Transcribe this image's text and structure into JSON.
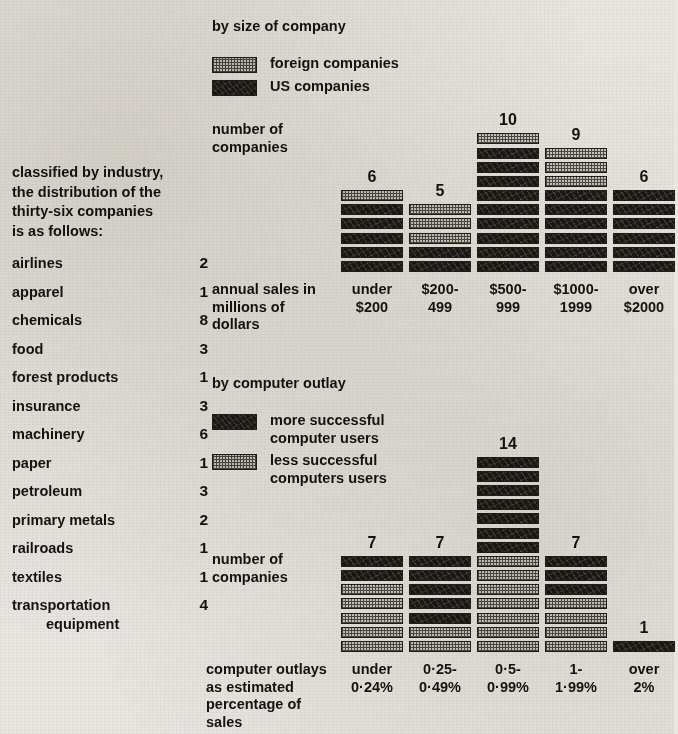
{
  "left_panel": {
    "intro": "classified by industry,\nthe distribution of the\nthirty-six companies\nis as follows:",
    "rows": [
      {
        "name": "airlines",
        "value": "2"
      },
      {
        "name": "apparel",
        "value": "1"
      },
      {
        "name": "chemicals",
        "value": "8"
      },
      {
        "name": "food",
        "value": "3"
      },
      {
        "name": "forest products",
        "value": "1"
      },
      {
        "name": "insurance",
        "value": "3"
      },
      {
        "name": "machinery",
        "value": "6"
      },
      {
        "name": "paper",
        "value": "1"
      },
      {
        "name": "petroleum",
        "value": "3"
      },
      {
        "name": "primary metals",
        "value": "2"
      },
      {
        "name": "railroads",
        "value": "1"
      },
      {
        "name": "textiles",
        "value": "1"
      },
      {
        "name": "transportation",
        "value": "4"
      }
    ],
    "continuation": "equipment"
  },
  "chart_top": {
    "title": "by size of company",
    "y_axis_label": "number of\ncompanies",
    "x_axis_label": "annual sales in\nmillions of\ndollars",
    "legend": [
      {
        "key": "foreign",
        "label": "foreign companies",
        "swatch": "light"
      },
      {
        "key": "us",
        "label": "US companies",
        "swatch": "dark"
      }
    ]
  },
  "chart_bottom": {
    "title": "by computer outlay",
    "y_axis_label": "number of\ncompanies",
    "x_axis_label": "computer outlays\nas estimated\npercentage of\nsales",
    "legend": [
      {
        "key": "more",
        "label": "more successful\ncomputer users",
        "swatch": "dark"
      },
      {
        "key": "less",
        "label": "less successful\ncomputers users",
        "swatch": "light"
      }
    ]
  },
  "colors": {
    "paper": "#e8e6e1",
    "ink": "#15130f",
    "dark_fill": "#1b1814",
    "light_fill": "#cbc8c0"
  },
  "chart_data": [
    {
      "id": "by-size-of-company",
      "type": "bar",
      "stacked": true,
      "title": "by size of company",
      "xlabel": "annual sales in millions of dollars",
      "ylabel": "number of companies",
      "categories": [
        "under\n$200",
        "$200-\n499",
        "$500-\n999",
        "$1000-\n1999",
        "over\n$2000"
      ],
      "series": [
        {
          "name": "foreign companies",
          "values": [
            1,
            3,
            1,
            3,
            0
          ]
        },
        {
          "name": "US companies",
          "values": [
            5,
            2,
            9,
            6,
            6
          ]
        }
      ],
      "totals": [
        6,
        5,
        10,
        9,
        6
      ],
      "stack_order_top_to_bottom": [
        "foreign companies",
        "US companies"
      ],
      "ylim": [
        0,
        14
      ],
      "grid": false,
      "legend_position": "top-left",
      "unit": "one block = one company"
    },
    {
      "id": "by-computer-outlay",
      "type": "bar",
      "stacked": true,
      "title": "by computer outlay",
      "xlabel": "computer outlays as estimated percentage of sales",
      "ylabel": "number of companies",
      "categories": [
        "under\n0·24%",
        "0·25-\n0·49%",
        "0·5-\n0·99%",
        "1-\n1·99%",
        "over\n2%"
      ],
      "series": [
        {
          "name": "more successful computer users",
          "values": [
            2,
            5,
            7,
            3,
            1
          ]
        },
        {
          "name": "less successful computers users",
          "values": [
            5,
            2,
            7,
            4,
            0
          ]
        }
      ],
      "totals": [
        7,
        7,
        14,
        7,
        1
      ],
      "stack_order_top_to_bottom": [
        "more successful computer users",
        "less successful computers users"
      ],
      "ylim": [
        0,
        14
      ],
      "grid": false,
      "legend_position": "top-left",
      "unit": "one block = one company"
    }
  ]
}
